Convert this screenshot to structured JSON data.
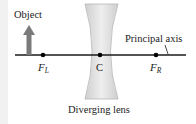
{
  "diagram": {
    "labels": {
      "object": "Object",
      "principal_axis": "Principal axis",
      "center": "C",
      "focal_left": "F",
      "focal_left_sub": "L",
      "focal_right": "F",
      "focal_right_sub": "R",
      "lens": "Diverging lens"
    },
    "colors": {
      "object_arrow": "#7a7a7a",
      "lens_fill": "#d8d8d8",
      "lens_edge": "#b9b9b9",
      "axis": "#1a1a1a",
      "point": "#000000"
    }
  }
}
